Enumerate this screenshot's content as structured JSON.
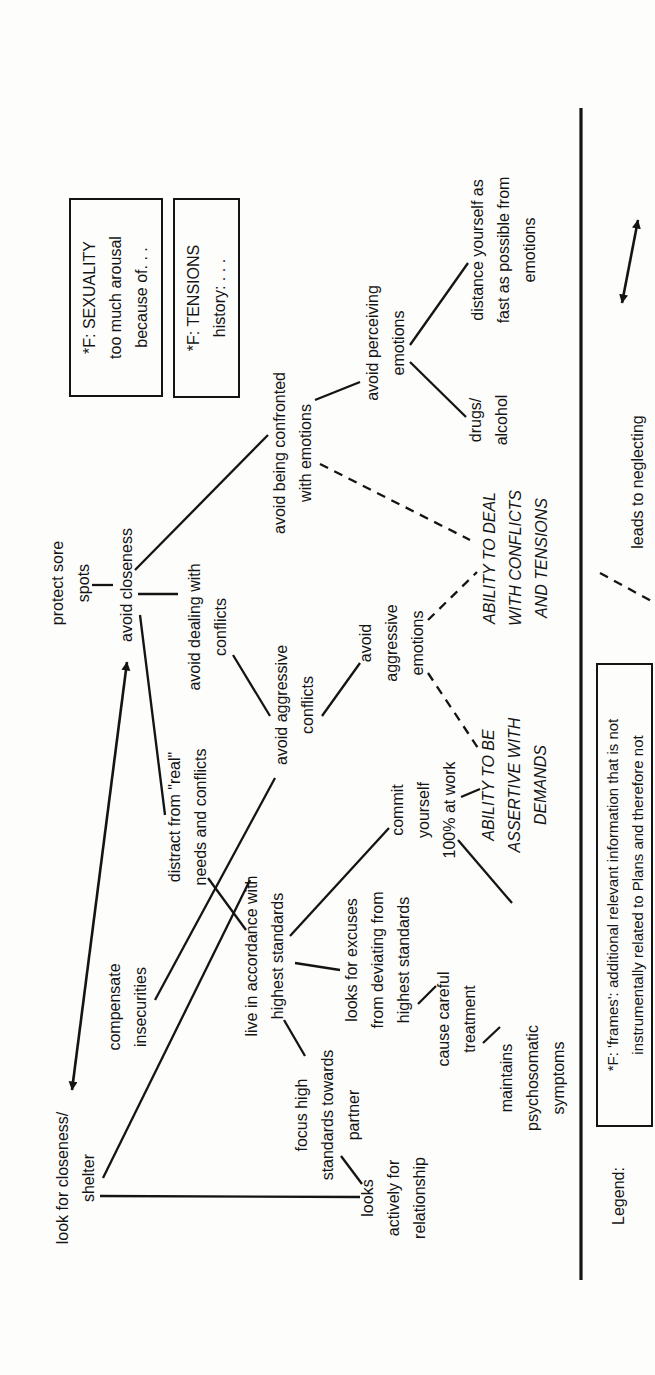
{
  "figure": {
    "width": 655,
    "height": 1375,
    "orientation": "rotated-90-ccw",
    "colors": {
      "ink": "#141414",
      "paper": "#fdfdfc"
    },
    "nodes": [
      {
        "id": "look-for-closeness-shelter",
        "text": "look for closeness/\nshelter",
        "x": 197,
        "y": 76,
        "style": "plain"
      },
      {
        "id": "protect-sore-spots",
        "text": "protect sore\nspots",
        "x": 792,
        "y": 71,
        "style": "plain"
      },
      {
        "id": "avoid-closeness",
        "text": "avoid closeness",
        "x": 790,
        "y": 127,
        "style": "plain"
      },
      {
        "id": "avoid-being-confronted",
        "text": "avoid being confronted\nwith emotions",
        "x": 922,
        "y": 293,
        "style": "plain"
      },
      {
        "id": "avoid-perceiving-emotions",
        "text": "avoid perceiving\nemotions",
        "x": 1032,
        "y": 386,
        "style": "plain"
      },
      {
        "id": "distance-yourself",
        "text": "distance yourself as\nfast as possible from\nemotions",
        "x": 1125,
        "y": 504,
        "style": "plain"
      },
      {
        "id": "drugs-alcohol",
        "text": "drugs/\nalcohol",
        "x": 955,
        "y": 489,
        "style": "plain"
      },
      {
        "id": "avoid-dealing-with-conflicts",
        "text": "avoid dealing with\nconflicts",
        "x": 748,
        "y": 208,
        "style": "plain"
      },
      {
        "id": "avoid-aggressive-conflicts",
        "text": "avoid aggressive\nconflicts",
        "x": 670,
        "y": 295,
        "style": "plain"
      },
      {
        "id": "avoid-aggressive-emotions",
        "text": "avoid\naggressive\nemotions",
        "x": 732,
        "y": 392,
        "style": "plain"
      },
      {
        "id": "ability-deal-conflicts-tensions",
        "text": "ABILITY TO DEAL\nWITH CONFLICTS\nAND TENSIONS",
        "x": 817,
        "y": 516,
        "style": "italic"
      },
      {
        "id": "ability-assertive-demands",
        "text": "ABILITY TO BE\nASSERTIVE WITH\nDEMANDS",
        "x": 590,
        "y": 515,
        "style": "italic"
      },
      {
        "id": "distract-from-real-needs",
        "text": "distract from \"real\"\nneeds and conflicts",
        "x": 558,
        "y": 188,
        "style": "plain"
      },
      {
        "id": "compensate-insecurities",
        "text": "compensate\ninsecurities",
        "x": 368,
        "y": 128,
        "style": "plain"
      },
      {
        "id": "live-in-accordance",
        "text": "live in accordance with\nhighest standards",
        "x": 419,
        "y": 265,
        "style": "plain"
      },
      {
        "id": "commit-yourself-work",
        "text": "commit\nyourself\n100% at work",
        "x": 565,
        "y": 424,
        "style": "plain"
      },
      {
        "id": "looks-for-excuses",
        "text": "looks for excuses\nfrom deviating from\nhighest standards",
        "x": 415,
        "y": 378,
        "style": "plain"
      },
      {
        "id": "focus-high-standards-partner",
        "text": "focus high\nstandards towards\npartner",
        "x": 260,
        "y": 328,
        "style": "plain"
      },
      {
        "id": "cause-careful-treatment",
        "text": "cause careful\ntreatment",
        "x": 356,
        "y": 457,
        "style": "plain"
      },
      {
        "id": "maintains-psychosomatic",
        "text": "maintains\npsychosomatic\nsymptoms",
        "x": 297,
        "y": 533,
        "style": "plain"
      },
      {
        "id": "looks-actively-relationship",
        "text": "looks\nactively for\nrelationship",
        "x": 177,
        "y": 394,
        "style": "plain"
      },
      {
        "id": "legend-title",
        "text": "Legend:",
        "x": 179,
        "y": 619,
        "style": "plain"
      },
      {
        "id": "legend-dashed-label",
        "text": "leads to neglecting",
        "x": 893,
        "y": 638,
        "style": "plain"
      }
    ],
    "frames": [
      {
        "id": "frame-sexuality",
        "text": "*F: SEXUALITY\ntoo much arousal\nbecause of. . .",
        "x": 978,
        "y": 69,
        "w": 199,
        "h": 94
      },
      {
        "id": "frame-tensions",
        "text": "*F: TENSIONS\nhistory: . . .",
        "x": 977,
        "y": 173,
        "w": 200,
        "h": 67
      },
      {
        "id": "legend-frames-note",
        "text": "*F: 'frames': additional relevant information that is not\ninstrumentally related to Plans and therefore not",
        "x": 248,
        "y": 596,
        "w": 464,
        "h": 57,
        "small": true
      }
    ],
    "edges": [
      {
        "id": "closeness-shelter--avoid-closeness",
        "x1": 285,
        "y1": 72,
        "x2": 713,
        "y2": 127,
        "style": "double-arrow"
      },
      {
        "id": "protect-sore-spots--avoid-closeness",
        "x1": 790,
        "y1": 92,
        "x2": 790,
        "y2": 113,
        "style": "solid"
      },
      {
        "id": "avoid-closeness--avoid-dealing",
        "x1": 781,
        "y1": 138,
        "x2": 781,
        "y2": 178,
        "style": "solid"
      },
      {
        "id": "avoid-closeness--avoid-being-confronted",
        "x1": 805,
        "y1": 135,
        "x2": 940,
        "y2": 268,
        "style": "solid"
      },
      {
        "id": "avoid-being-confronted--avoid-perceiving",
        "x1": 975,
        "y1": 315,
        "x2": 993,
        "y2": 360,
        "style": "solid"
      },
      {
        "id": "avoid-perceiving--distance-yourself",
        "x1": 1030,
        "y1": 410,
        "x2": 1112,
        "y2": 468,
        "style": "solid"
      },
      {
        "id": "avoid-perceiving--drugs-alcohol",
        "x1": 1013,
        "y1": 410,
        "x2": 958,
        "y2": 466,
        "style": "solid"
      },
      {
        "id": "avoid-closeness--distract-from-real",
        "x1": 760,
        "y1": 140,
        "x2": 560,
        "y2": 165,
        "style": "solid"
      },
      {
        "id": "avoid-dealing--avoid-aggressive-conflicts",
        "x1": 720,
        "y1": 233,
        "x2": 659,
        "y2": 270,
        "style": "solid"
      },
      {
        "id": "avoid-aggressive-conflicts--avoid-aggressive-emotions",
        "x1": 659,
        "y1": 322,
        "x2": 712,
        "y2": 360,
        "style": "solid"
      },
      {
        "id": "avoid-being-confronted--ability-deal",
        "x1": 911,
        "y1": 320,
        "x2": 835,
        "y2": 470,
        "style": "dashed"
      },
      {
        "id": "avoid-aggressive-emotions--ability-deal",
        "x1": 755,
        "y1": 428,
        "x2": 803,
        "y2": 477,
        "style": "dashed"
      },
      {
        "id": "avoid-aggressive-emotions--ability-assertive",
        "x1": 702,
        "y1": 428,
        "x2": 627,
        "y2": 478,
        "style": "dashed"
      },
      {
        "id": "commit--ability-assertive",
        "x1": 578,
        "y1": 461,
        "x2": 586,
        "y2": 480,
        "style": "solid"
      },
      {
        "id": "commit--lower-link",
        "x1": 535,
        "y1": 458,
        "x2": 472,
        "y2": 512,
        "style": "solid"
      },
      {
        "id": "compensate--avoid-aggressive-conflicts",
        "x1": 375,
        "y1": 155,
        "x2": 597,
        "y2": 275,
        "style": "solid"
      },
      {
        "id": "shelter--live-in-accordance",
        "x1": 197,
        "y1": 103,
        "x2": 495,
        "y2": 250,
        "style": "solid"
      },
      {
        "id": "distract--live-in-accordance",
        "x1": 497,
        "y1": 208,
        "x2": 445,
        "y2": 246,
        "style": "solid"
      },
      {
        "id": "live-in-accordance--commit",
        "x1": 439,
        "y1": 290,
        "x2": 547,
        "y2": 389,
        "style": "solid"
      },
      {
        "id": "live-in-accordance--focus-high",
        "x1": 355,
        "y1": 284,
        "x2": 319,
        "y2": 305,
        "style": "solid"
      },
      {
        "id": "live-in-accordance--looks-for-excuses",
        "x1": 412,
        "y1": 295,
        "x2": 405,
        "y2": 340,
        "style": "solid"
      },
      {
        "id": "looks-for-excuses--cause-careful",
        "x1": 371,
        "y1": 418,
        "x2": 389,
        "y2": 436,
        "style": "solid"
      },
      {
        "id": "cause-careful--maintains",
        "x1": 332,
        "y1": 483,
        "x2": 348,
        "y2": 500,
        "style": "solid"
      },
      {
        "id": "focus-partner--looks-actively",
        "x1": 219,
        "y1": 341,
        "x2": 191,
        "y2": 362,
        "style": "solid"
      },
      {
        "id": "shelter--looks-actively",
        "x1": 179,
        "y1": 100,
        "x2": 178,
        "y2": 360,
        "style": "solid"
      },
      {
        "id": "legend-separator",
        "x1": 95,
        "y1": 581,
        "x2": 1267,
        "y2": 581,
        "style": "separator"
      },
      {
        "id": "legend-dashed-sample",
        "x1": 802,
        "y1": 600,
        "x2": 773,
        "y2": 653,
        "style": "dashed"
      },
      {
        "id": "legend-conflict-arrow",
        "x1": 1072,
        "y1": 622,
        "x2": 1155,
        "y2": 638,
        "style": "double-arrow"
      }
    ]
  }
}
